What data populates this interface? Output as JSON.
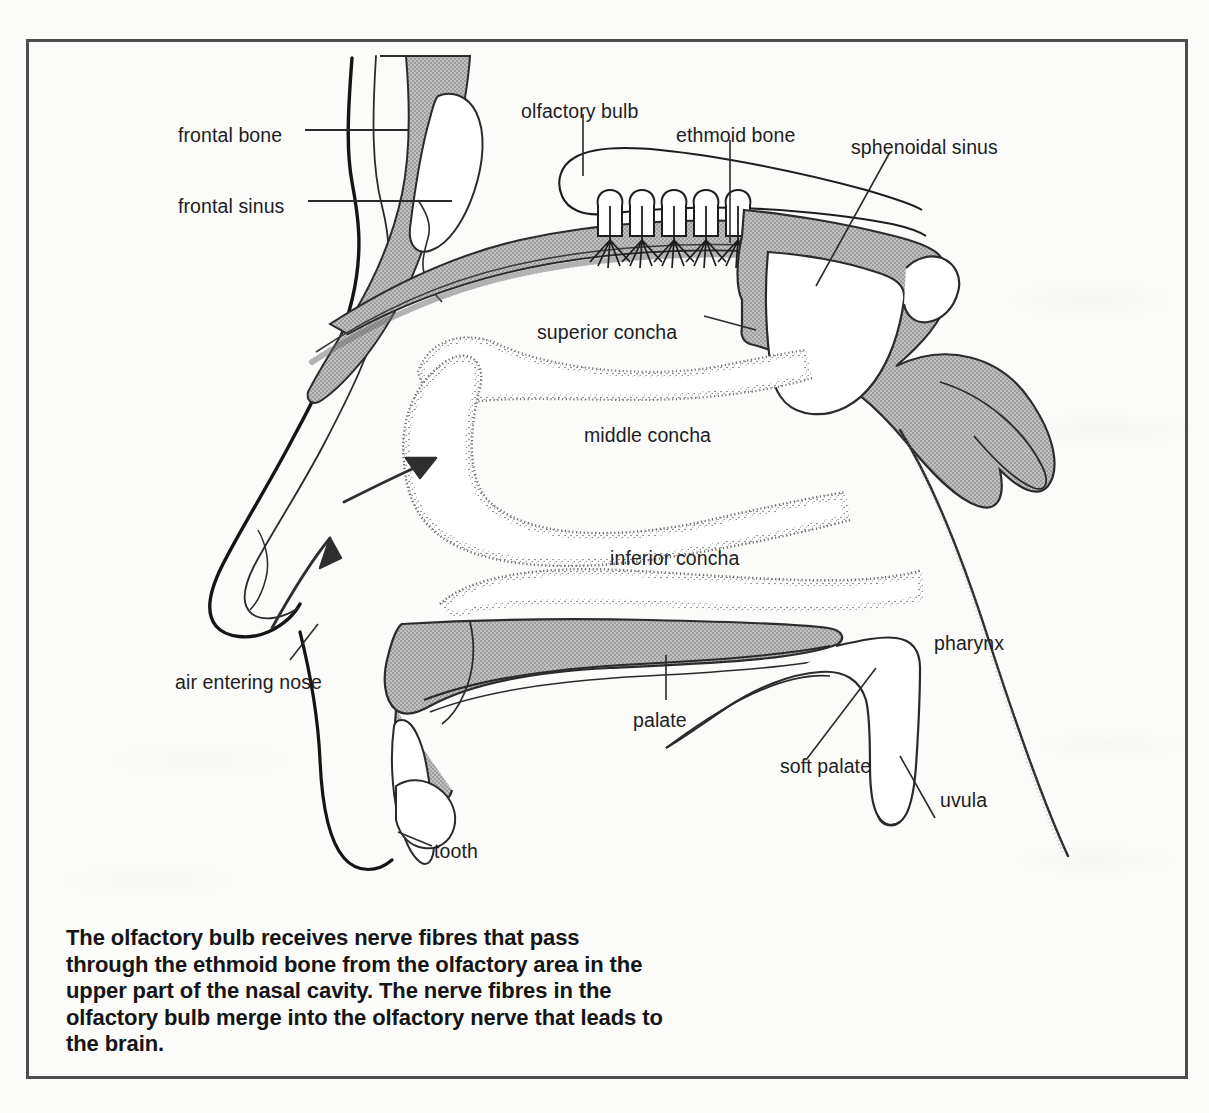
{
  "figure": {
    "caption": "The olfactory bulb receives nerve fibres that pass through the ethmoid bone from the olfactory area in the upper part of the nasal cavity. The nerve fibres in the olfactory bulb merge into the olfactory nerve that leads to the brain.",
    "frame_color": "#4e4e4e",
    "background_color": "#fbfbfa",
    "bone_fill_color": "#b3b3b3",
    "ink_color": "#1d1d1d"
  },
  "labels": [
    {
      "id": "frontal-bone",
      "text": "frontal bone",
      "x": 178,
      "y": 124,
      "anchor": "start"
    },
    {
      "id": "frontal-sinus",
      "text": "frontal sinus",
      "x": 178,
      "y": 195,
      "anchor": "start"
    },
    {
      "id": "olfactory-bulb",
      "text": "olfactory bulb",
      "x": 521,
      "y": 100,
      "anchor": "start"
    },
    {
      "id": "ethmoid-bone",
      "text": "ethmoid bone",
      "x": 676,
      "y": 124,
      "anchor": "start"
    },
    {
      "id": "sphenoidal-sinus",
      "text": "sphenoidal sinus",
      "x": 851,
      "y": 136,
      "anchor": "start"
    },
    {
      "id": "superior-concha",
      "text": "superior concha",
      "x": 537,
      "y": 321,
      "anchor": "start"
    },
    {
      "id": "middle-concha",
      "text": "middle concha",
      "x": 584,
      "y": 424,
      "anchor": "start"
    },
    {
      "id": "inferior-concha",
      "text": "inferior concha",
      "x": 610,
      "y": 547,
      "anchor": "start"
    },
    {
      "id": "air-entering-nose",
      "text": "air entering nose",
      "x": 175,
      "y": 671,
      "anchor": "start"
    },
    {
      "id": "pharynx",
      "text": "pharynx",
      "x": 934,
      "y": 632,
      "anchor": "start"
    },
    {
      "id": "palate",
      "text": "palate",
      "x": 633,
      "y": 709,
      "anchor": "start"
    },
    {
      "id": "soft-palate",
      "text": "soft palate",
      "x": 780,
      "y": 755,
      "anchor": "start"
    },
    {
      "id": "uvula",
      "text": "uvula",
      "x": 940,
      "y": 789,
      "anchor": "start"
    },
    {
      "id": "tooth",
      "text": "tooth",
      "x": 434,
      "y": 840,
      "anchor": "start"
    }
  ],
  "annotations": {
    "airflow_arrows": 2,
    "olfactory_nerve_bundles": 5
  }
}
